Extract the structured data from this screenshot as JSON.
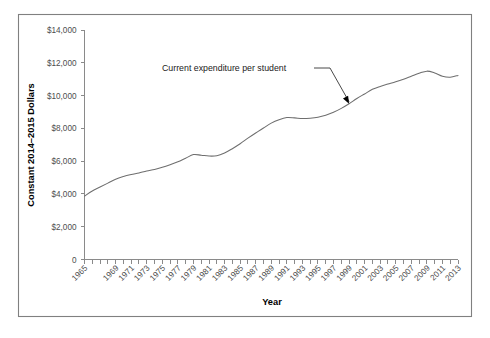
{
  "figure": {
    "border_color": "#808080",
    "background": "#ffffff"
  },
  "chart_data": {
    "type": "line",
    "title": "",
    "subtitle": "",
    "xlabel": "Year",
    "ylabel": "Constant 2014–2015 Dollars",
    "xlim": [
      1965,
      2013
    ],
    "ylim": [
      0,
      14000
    ],
    "grid": false,
    "legend_position": "none",
    "line_color": "#6e6e6e",
    "ytick_labels": [
      "0",
      "$2,000",
      "$4,000",
      "$6,000",
      "$8,000",
      "$10,000",
      "$12,000",
      "$14,000"
    ],
    "ytick_values": [
      0,
      2000,
      4000,
      6000,
      8000,
      10000,
      12000,
      14000
    ],
    "xtick_labels": [
      "1965",
      "1969",
      "1971",
      "1973",
      "1975",
      "1977",
      "1979",
      "1981",
      "1983",
      "1985",
      "1987",
      "1989",
      "1991",
      "1993",
      "1995",
      "1997",
      "1999",
      "2001",
      "2003",
      "2005",
      "2007",
      "2009",
      "2011",
      "2013"
    ],
    "xtick_label_values": [
      1965,
      1969,
      1971,
      1973,
      1975,
      1977,
      1979,
      1981,
      1983,
      1985,
      1987,
      1989,
      1991,
      1993,
      1995,
      1997,
      1999,
      2001,
      2003,
      2005,
      2007,
      2009,
      2011,
      2013
    ],
    "x": [
      1965,
      1966,
      1967,
      1968,
      1969,
      1970,
      1971,
      1972,
      1973,
      1974,
      1975,
      1976,
      1977,
      1978,
      1979,
      1980,
      1981,
      1982,
      1983,
      1984,
      1985,
      1986,
      1987,
      1988,
      1989,
      1990,
      1991,
      1992,
      1993,
      1994,
      1995,
      1996,
      1997,
      1998,
      1999,
      2000,
      2001,
      2002,
      2003,
      2004,
      2005,
      2006,
      2007,
      2008,
      2009,
      2010,
      2011,
      2012,
      2013
    ],
    "series": [
      {
        "name": "Current expenditure per student",
        "values": [
          3870,
          4180,
          4420,
          4660,
          4900,
          5060,
          5180,
          5280,
          5400,
          5490,
          5620,
          5780,
          5960,
          6180,
          6400,
          6360,
          6310,
          6330,
          6500,
          6760,
          7060,
          7400,
          7720,
          8020,
          8320,
          8530,
          8660,
          8640,
          8600,
          8620,
          8680,
          8800,
          8980,
          9220,
          9500,
          9820,
          10100,
          10380,
          10560,
          10700,
          10840,
          11000,
          11180,
          11360,
          11490,
          11380,
          11180,
          11120,
          11230
        ]
      }
    ],
    "annotations": [
      {
        "text": "Current expenditure per student",
        "points_to_year": 1999,
        "points_to_value": 9500
      }
    ]
  }
}
